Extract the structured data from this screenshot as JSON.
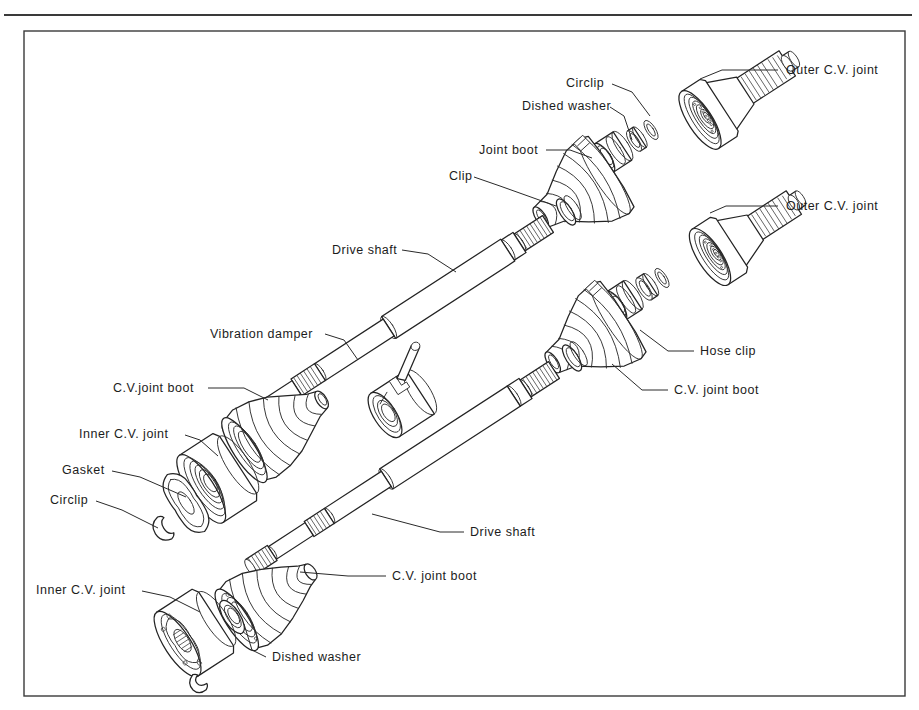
{
  "page": {
    "background_color": "#ffffff",
    "ink_color": "#232323",
    "frame_color": "#3a3a3a"
  },
  "frame": {
    "top_rule": true,
    "inner_border": true
  },
  "diagram": {
    "type": "exploded-assembly",
    "assembly_count": 2,
    "assemblies": [
      {
        "name": "upper-drive-shaft-assembly",
        "components": [
          "Outer C.V. joint",
          "Circlip",
          "Dished washer",
          "Joint boot",
          "Clip",
          "Drive shaft",
          "Vibration damper",
          "C.V.joint boot",
          "Inner C.V. joint",
          "Gasket",
          "Circlip"
        ]
      },
      {
        "name": "lower-drive-shaft-assembly",
        "components": [
          "Outer C.V. joint",
          "Hose clip",
          "C.V. joint boot",
          "Drive shaft",
          "C.V. joint boot",
          "Dished washer",
          "Inner C.V. joint"
        ]
      }
    ]
  },
  "labels": [
    {
      "id": "outer-cv-joint-upper",
      "text": "Outer C.V. joint",
      "x": 786,
      "y": 74,
      "anchor": "start",
      "leader": "M 778 70 L 722 70 L 700 79"
    },
    {
      "id": "circlip-upper",
      "text": "Circlip",
      "x": 566,
      "y": 87,
      "anchor": "start",
      "leader": "M 612 84 L 632 92 L 650 116"
    },
    {
      "id": "dished-washer-upper",
      "text": "Dished washer",
      "x": 522,
      "y": 110,
      "anchor": "start",
      "leader": "M 610 107 L 624 116 L 632 140"
    },
    {
      "id": "joint-boot",
      "text": "Joint boot",
      "x": 479,
      "y": 154,
      "anchor": "start",
      "leader": "M 546 150 L 570 150 L 592 158"
    },
    {
      "id": "clip-upper",
      "text": "Clip",
      "x": 449,
      "y": 180,
      "anchor": "start",
      "leader": "M 474 177 L 500 186 L 556 206"
    },
    {
      "id": "outer-cv-joint-lower",
      "text": "Outer C.V. joint",
      "x": 786,
      "y": 210,
      "anchor": "start",
      "leader": "M 778 206 L 726 206 L 710 213"
    },
    {
      "id": "drive-shaft-upper",
      "text": "Drive shaft",
      "x": 332,
      "y": 254,
      "anchor": "start",
      "leader": "M 402 250 L 428 254 L 456 272"
    },
    {
      "id": "vibration-damper",
      "text": "Vibration damper",
      "x": 210,
      "y": 338,
      "anchor": "start",
      "leader": "M 325 334 L 344 340 L 358 360"
    },
    {
      "id": "hose-clip",
      "text": "Hose clip",
      "x": 700,
      "y": 355,
      "anchor": "start",
      "leader": "M 694 351 L 668 351 L 640 330"
    },
    {
      "id": "cv-joint-boot-upper",
      "text": "C.V.joint boot",
      "x": 113,
      "y": 392,
      "anchor": "start",
      "leader": "M 208 388 L 244 388 L 268 400"
    },
    {
      "id": "cv-joint-boot-right",
      "text": "C.V. joint boot",
      "x": 674,
      "y": 394,
      "anchor": "start",
      "leader": "M 668 390 L 642 390 L 612 364"
    },
    {
      "id": "inner-cv-joint-upper",
      "text": "Inner C.V. joint",
      "x": 79,
      "y": 438,
      "anchor": "start",
      "leader": "M 185 435 L 200 440 L 218 456"
    },
    {
      "id": "gasket",
      "text": "Gasket",
      "x": 62,
      "y": 474,
      "anchor": "start",
      "leader": "M 112 471 L 140 477 L 186 497"
    },
    {
      "id": "circlip-lower",
      "text": "Circlip",
      "x": 50,
      "y": 504,
      "anchor": "start",
      "leader": "M 96 501 L 122 510 L 158 528"
    },
    {
      "id": "drive-shaft-lower",
      "text": "Drive shaft",
      "x": 470,
      "y": 536,
      "anchor": "start",
      "leader": "M 464 532 L 440 532 L 372 514"
    },
    {
      "id": "cv-joint-boot-lower",
      "text": "C.V. joint boot",
      "x": 392,
      "y": 580,
      "anchor": "start",
      "leader": "M 386 576 L 348 576 L 300 572"
    },
    {
      "id": "inner-cv-joint-lower",
      "text": "Inner C.V. joint",
      "x": 36,
      "y": 594,
      "anchor": "start",
      "leader": "M 142 591 L 170 597 L 200 612"
    },
    {
      "id": "dished-washer-lower",
      "text": "Dished washer",
      "x": 272,
      "y": 661,
      "anchor": "start",
      "leader": "M 266 657 L 252 650 L 244 624"
    }
  ]
}
